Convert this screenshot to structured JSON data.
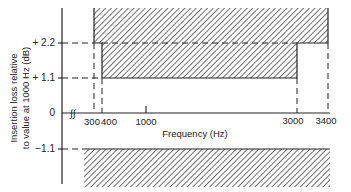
{
  "diagram": {
    "ylabel_line1": "Insertion loss relative",
    "ylabel_line2": "to value at 1000 Hz (dB)",
    "xlabel": "Frequency (Hz)",
    "y_ticks": [
      "+ 2.2",
      "+ 1.1",
      "0",
      "−1.1"
    ],
    "x_ticks": [
      "300",
      "400",
      "1000",
      "3000",
      "3400"
    ],
    "axis_break_symbol": "∫∫",
    "colors": {
      "line": "#222222",
      "hatch": "#333333",
      "background": "#ffffff"
    }
  }
}
